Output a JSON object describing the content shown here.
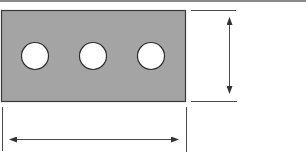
{
  "diagram": {
    "type": "dimensioned plate drawing",
    "plate": {
      "shape": "rectangle",
      "x": 1,
      "y": 10,
      "width": 184,
      "height": 91,
      "fill": "#a4a4a4",
      "stroke": "#3a3a3a"
    },
    "holes": [
      {
        "cx": 35,
        "cy": 56,
        "r": 13.5
      },
      {
        "cx": 93,
        "cy": 56,
        "r": 13.5
      },
      {
        "cx": 151,
        "cy": 56,
        "r": 13.5
      }
    ],
    "hole_fill": "#ffffff",
    "dimensions": {
      "height": {
        "orientation": "vertical",
        "extension_lines": [
          {
            "x1": 191,
            "y1": 10,
            "x2": 236,
            "y2": 10
          },
          {
            "x1": 191,
            "y1": 101,
            "x2": 237,
            "y2": 101
          }
        ],
        "arrow": {
          "x": 229,
          "y1": 12,
          "y2": 99
        },
        "label": ""
      },
      "width": {
        "orientation": "horizontal",
        "extension_lines": [
          {
            "x1": 2,
            "y1": 107,
            "x2": 2,
            "y2": 151
          },
          {
            "x1": 186,
            "y1": 107,
            "x2": 186,
            "y2": 152
          }
        ],
        "arrow": {
          "y": 139,
          "x1": 4,
          "x2": 184
        },
        "label": ""
      }
    },
    "line_color": "#4a4a4a",
    "top_band_color": "#8a8a8a"
  }
}
